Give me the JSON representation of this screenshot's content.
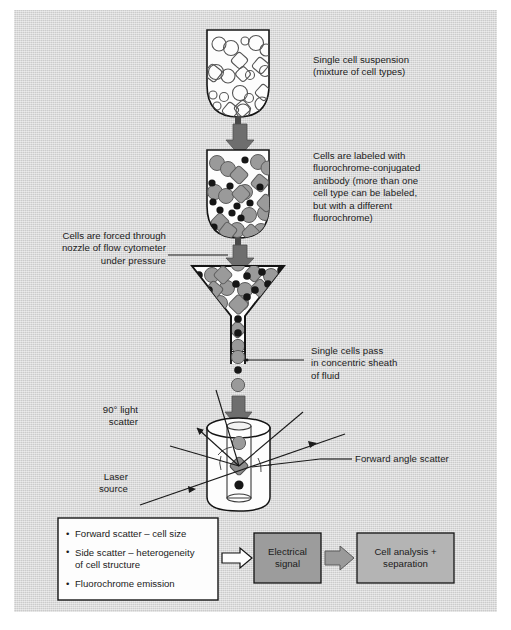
{
  "figure": {
    "background_color": "#d6d6d6",
    "frame_color": "#ffffff",
    "ink_color": "#1b1b1b"
  },
  "palette": {
    "cell_gray": "#9a9a9a",
    "cell_gray_dark": "#8d8d8d",
    "dot_black": "#161616",
    "arrow_gray": "#6e6e6e",
    "tube_fill": "#fdfdfd",
    "box_fill": "#fdfdfd",
    "electrical_box": "#9c9c9c",
    "analysis_box": "#b4b4b4",
    "outline": "#141414"
  },
  "labels": {
    "suspension": "Single cell suspension\n(mixture of cell types)",
    "labeled": "Cells are labeled with\nfluorochrome-conjugated\nantibody (more than one\ncell type can be labeled,\nbut with a different\nfluorochrome)",
    "nozzle": "Cells are forced through\nnozzle of flow cytometer\nunder pressure",
    "sheath": "Single cells pass\nin concentric sheath\nof fluid",
    "side_scatter": "90° light\nscatter",
    "laser": "Laser\nsource",
    "forward_scatter": "Forward angle scatter"
  },
  "summary_box": {
    "bullets": [
      "Forward scatter – cell size",
      "Side scatter – heterogeneity\nof cell structure",
      "Fluorochrome emission"
    ]
  },
  "process_boxes": [
    {
      "name": "electrical-signal",
      "text": "Electrical\nsignal",
      "fill": "#9c9c9c"
    },
    {
      "name": "cell-analysis",
      "text": "Cell analysis +\nseparation",
      "fill": "#b4b4b4"
    }
  ],
  "stages": [
    {
      "name": "tube-unlabeled",
      "caption_key": "suspension"
    },
    {
      "name": "tube-labeled",
      "caption_key": "labeled"
    },
    {
      "name": "nozzle-funnel",
      "caption_key": "nozzle"
    },
    {
      "name": "cell-stream",
      "caption_key": "sheath"
    },
    {
      "name": "flow-cell-chamber",
      "caption_key": "side_scatter"
    }
  ],
  "icons": {
    "down_arrow": "block-down-arrow",
    "right_arrow": "block-right-arrow",
    "leader_line": "leader-line",
    "laser_beam": "laser-beam-arrow",
    "scatter_ray": "scatter-ray-arrow"
  }
}
